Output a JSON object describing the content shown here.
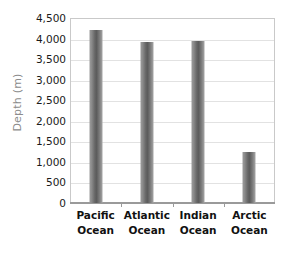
{
  "chart_data": {
    "type": "bar",
    "title": "",
    "xlabel": "",
    "ylabel": "Depth (m)",
    "categories": [
      "Pacific Ocean",
      "Atlantic Ocean",
      "Indian Ocean",
      "Arctic Ocean"
    ],
    "category_lines": [
      [
        "Pacific",
        "Ocean"
      ],
      [
        "Atlantic",
        "Ocean"
      ],
      [
        "Indian",
        "Ocean"
      ],
      [
        "Arctic",
        "Ocean"
      ]
    ],
    "values": [
      4200,
      3920,
      3950,
      1250
    ],
    "ylim": [
      0,
      4500
    ],
    "ytick_step": 500,
    "ytick_labels": [
      "4,500",
      "4,000",
      "3,500",
      "3,000",
      "2,500",
      "2,000",
      "1,500",
      "1,000",
      "500",
      "0"
    ],
    "ytick_values": [
      4500,
      4000,
      3500,
      3000,
      2500,
      2000,
      1500,
      1000,
      500,
      0
    ],
    "grid": true,
    "legend": false,
    "legend_position": "none",
    "colors": {
      "bar_light": "#9b9b9b",
      "bar_dark": "#5c5c5c",
      "gridline": "#e2e2e2",
      "plot_border": "#c9c9c9",
      "axis_line": "#9a9a9a",
      "tick_label": "#1a1a1a",
      "axis_title": "#8c8c8c",
      "background": "#ffffff"
    }
  }
}
